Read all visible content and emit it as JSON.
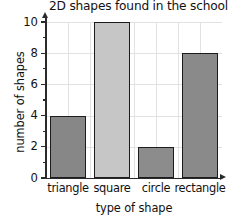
{
  "chart_data": {
    "type": "bar",
    "title": "2D shapes found in the school hall",
    "xlabel": "type of shape",
    "ylabel": "number of shapes",
    "categories": [
      "triangle",
      "square",
      "circle",
      "rectangle"
    ],
    "values": [
      4,
      10,
      2,
      8
    ],
    "ylim": [
      0,
      10
    ],
    "ytick_step": 2,
    "yminor_tick_step": 1,
    "ytick_labels": [
      "0",
      "2",
      "4",
      "6",
      "8",
      "10"
    ],
    "grid": true,
    "legend": "none",
    "bar_colors": [
      "#878787",
      "#c6c6c6",
      "#8c8c8c",
      "#8a8a8a"
    ],
    "bar_edge_color": "#1c1c1c",
    "grid_color": "#e2e2e2",
    "axis_color": "#2b2b2b",
    "background_color": "#ffffff"
  }
}
